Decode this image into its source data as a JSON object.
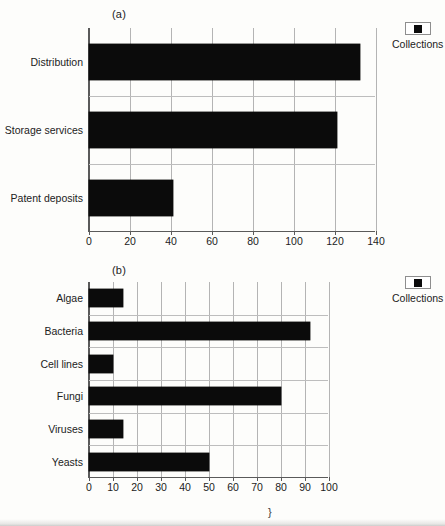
{
  "chart_data": [
    {
      "type": "bar",
      "orientation": "horizontal",
      "panel": "(a)",
      "title": "",
      "xlabel": "",
      "ylabel": "",
      "categories": [
        "Distribution",
        "Storage services",
        "Patent deposits"
      ],
      "values": [
        132,
        121,
        41
      ],
      "series": [
        {
          "name": "Collections",
          "values": [
            132,
            121,
            41
          ],
          "color": "#0b0b0b"
        }
      ],
      "xlim": [
        0,
        140
      ],
      "xticks": [
        0,
        20,
        40,
        60,
        80,
        100,
        120,
        140
      ],
      "xticklabels": [
        "0",
        "20",
        "40",
        "60",
        "80",
        "100",
        "120",
        "140"
      ],
      "grid": "vertical-and-category-separators",
      "legend": {
        "position": "right-top",
        "entries": [
          "Collections"
        ]
      }
    },
    {
      "type": "bar",
      "orientation": "horizontal",
      "panel": "(b)",
      "title": "",
      "xlabel": "",
      "ylabel": "",
      "categories": [
        "Algae",
        "Bacteria",
        "Cell lines",
        "Fungi",
        "Viruses",
        "Yeasts"
      ],
      "values": [
        14,
        92,
        10,
        80,
        14,
        50
      ],
      "series": [
        {
          "name": "Collections",
          "values": [
            14,
            92,
            10,
            80,
            14,
            50
          ],
          "color": "#0b0b0b"
        }
      ],
      "xlim": [
        0,
        100
      ],
      "xticks": [
        0,
        10,
        20,
        30,
        40,
        50,
        60,
        70,
        80,
        90,
        100
      ],
      "xticklabels": [
        "0",
        "10",
        "20",
        "30",
        "40",
        "50",
        "60",
        "70",
        "80",
        "90",
        "100"
      ],
      "grid": "vertical-and-category-separators",
      "legend": {
        "position": "right-top",
        "entries": [
          "Collections"
        ]
      }
    }
  ],
  "figure": {
    "panel_a": {
      "caption": "(a)",
      "legend_label": "Collections"
    },
    "panel_b": {
      "caption": "(b)",
      "legend_label": "Collections"
    },
    "page_artifact": "}"
  },
  "colors": {
    "bar": "#0b0b0b",
    "gridline": "#b4b4b4",
    "axis": "#5a5a5a",
    "background": "#fdfdfb",
    "text": "#222222"
  }
}
